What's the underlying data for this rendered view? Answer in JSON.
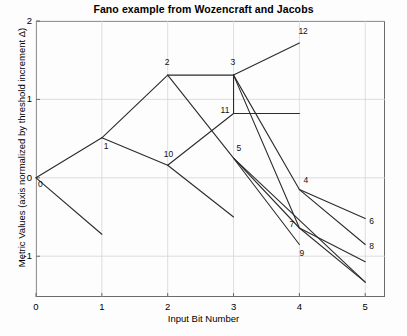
{
  "chart_data": {
    "type": "line",
    "title": "Fano example from Wozencraft and Jacobs",
    "xlabel": "Input Bit Number",
    "ylabel": "Metric Values (axis normalized by threshold increment Δ)",
    "xlim": [
      0,
      5.3
    ],
    "ylim": [
      -1.52,
      2
    ],
    "xticks": [
      0,
      1,
      2,
      3,
      4,
      5
    ],
    "xtick_labels": [
      "0",
      "1",
      "2",
      "3",
      "4",
      "5"
    ],
    "yticks": [
      -1,
      0,
      1,
      2
    ],
    "ytick_labels": [
      "-1",
      "0",
      "1",
      "2"
    ],
    "grid": true,
    "legend": "none",
    "series": [
      {
        "name": "path-root-down",
        "points": [
          [
            0,
            0.0
          ],
          [
            1,
            -0.72
          ]
        ]
      },
      {
        "name": "path-root-to-1",
        "points": [
          [
            0,
            0.0
          ],
          [
            1,
            0.51
          ]
        ]
      },
      {
        "name": "path-1-to-2",
        "points": [
          [
            1,
            0.51
          ],
          [
            2,
            1.31
          ]
        ]
      },
      {
        "name": "path-1-to-10",
        "points": [
          [
            1,
            0.51
          ],
          [
            2,
            0.16
          ]
        ]
      },
      {
        "name": "path-2-to-3",
        "points": [
          [
            2,
            1.31
          ],
          [
            3,
            1.31
          ]
        ]
      },
      {
        "name": "path-2-to-9",
        "points": [
          [
            2,
            1.31
          ],
          [
            3,
            0.25
          ],
          [
            4,
            -0.64
          ],
          [
            5,
            -1.33
          ]
        ]
      },
      {
        "name": "path-3-to-12",
        "points": [
          [
            3,
            1.31
          ],
          [
            4,
            1.72
          ]
        ]
      },
      {
        "name": "path-3-to-11",
        "points": [
          [
            3,
            1.31
          ],
          [
            3,
            0.82
          ]
        ]
      },
      {
        "name": "path-11-horizontal",
        "points": [
          [
            3,
            0.82
          ],
          [
            4,
            0.82
          ]
        ]
      },
      {
        "name": "path-3-to-4",
        "points": [
          [
            3,
            1.31
          ],
          [
            4,
            -0.15
          ]
        ]
      },
      {
        "name": "path-3-to-7",
        "points": [
          [
            3,
            1.31
          ],
          [
            4,
            -0.64
          ]
        ]
      },
      {
        "name": "path-4-to-6",
        "points": [
          [
            4,
            -0.15
          ],
          [
            5,
            -0.52
          ]
        ]
      },
      {
        "name": "path-4-to-8",
        "points": [
          [
            4,
            -0.15
          ],
          [
            5,
            -0.85
          ]
        ]
      },
      {
        "name": "path-5-to-9",
        "points": [
          [
            3,
            0.25
          ],
          [
            4,
            -0.85
          ]
        ]
      },
      {
        "name": "path-5-to-lower",
        "points": [
          [
            3,
            0.25
          ],
          [
            5,
            -1.33
          ]
        ]
      },
      {
        "name": "path-10-to-5",
        "points": [
          [
            2,
            0.16
          ],
          [
            3,
            0.82
          ]
        ]
      },
      {
        "name": "path-10-down",
        "points": [
          [
            2,
            0.16
          ],
          [
            3,
            -0.5
          ]
        ]
      },
      {
        "name": "path-7-to-end",
        "points": [
          [
            4,
            -0.64
          ],
          [
            5,
            -1.07
          ]
        ]
      }
    ],
    "node_labels": [
      {
        "id": "0",
        "x": 0,
        "y": 0.0,
        "dx": 2,
        "dy": 7
      },
      {
        "id": "1",
        "x": 1,
        "y": 0.51,
        "dx": 2,
        "dy": 9
      },
      {
        "id": "2",
        "x": 2,
        "y": 1.31,
        "dx": -3,
        "dy": -12
      },
      {
        "id": "3",
        "x": 3,
        "y": 1.31,
        "dx": -3,
        "dy": -12
      },
      {
        "id": "12",
        "x": 4,
        "y": 1.72,
        "dx": -1,
        "dy": -11
      },
      {
        "id": "11",
        "x": 3,
        "y": 0.82,
        "dx": -13,
        "dy": -3
      },
      {
        "id": "10",
        "x": 2,
        "y": 0.16,
        "dx": -4,
        "dy": -10
      },
      {
        "id": "5",
        "x": 3,
        "y": 0.25,
        "dx": 3,
        "dy": -9
      },
      {
        "id": "4",
        "x": 4,
        "y": -0.15,
        "dx": 4,
        "dy": -9
      },
      {
        "id": "7",
        "x": 4,
        "y": -0.64,
        "dx": -10,
        "dy": -3
      },
      {
        "id": "9",
        "x": 4,
        "y": -0.85,
        "dx": 0,
        "dy": 10
      },
      {
        "id": "6",
        "x": 5,
        "y": -0.52,
        "dx": 4,
        "dy": 3
      },
      {
        "id": "8",
        "x": 5,
        "y": -0.85,
        "dx": 4,
        "dy": 3
      }
    ]
  }
}
